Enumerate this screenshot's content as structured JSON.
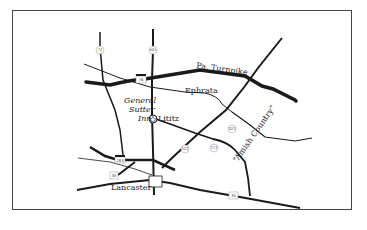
{
  "map": {
    "roads": {
      "turnpike": {
        "label": "Pa. Turnpike",
        "shield": "76"
      },
      "route_222": "222",
      "route_272": "772",
      "route_322": "322",
      "route_501": "501",
      "route_72": "72",
      "route_283": "283",
      "route_30_west": "30",
      "route_30_east": "30"
    },
    "places": {
      "ephrata": "Ephrata",
      "lititz": "Lititz",
      "lancaster": "Lancaster",
      "inn_line1": "General",
      "inn_line2": "Sutter",
      "inn_line3": "Inn",
      "region": "“Amish Country”"
    },
    "colors": {
      "road": "#1a1a1a",
      "border": "#444444",
      "background": "#ffffff"
    }
  }
}
